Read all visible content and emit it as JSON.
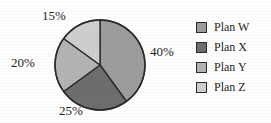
{
  "chart_data": {
    "type": "pie",
    "title": "",
    "subtitle": "",
    "xlabel": "",
    "ylabel": "",
    "grid": false,
    "legend_position": "right",
    "start_angle_deg": 0,
    "direction": "clockwise",
    "total": 100,
    "units": "percent",
    "categories": [
      "Plan W",
      "Plan X",
      "Plan Y",
      "Plan Z"
    ],
    "values": [
      40,
      25,
      20,
      15
    ],
    "data_labels": [
      "40%",
      "25%",
      "20%",
      "15%"
    ],
    "slices": [
      {
        "label": "Plan W",
        "value": 40,
        "data_label": "40%",
        "color": "#9d9d9d",
        "label_position": "right",
        "start_angle_deg": 0,
        "end_angle_deg": 144
      },
      {
        "label": "Plan X",
        "value": 25,
        "data_label": "25%",
        "color": "#6e6e6e",
        "label_position": "bottom",
        "start_angle_deg": 144,
        "end_angle_deg": 234
      },
      {
        "label": "Plan Y",
        "value": 20,
        "data_label": "20%",
        "color": "#b4b4b4",
        "label_position": "left",
        "start_angle_deg": 234,
        "end_angle_deg": 306
      },
      {
        "label": "Plan Z",
        "value": 15,
        "data_label": "15%",
        "color": "#cfcfcf",
        "label_position": "top-left",
        "start_angle_deg": 306,
        "end_angle_deg": 360
      }
    ],
    "geometry": {
      "center_x": 100,
      "center_y": 65,
      "radius": 45,
      "stroke_color": "#2b2b2b",
      "stroke_width": 1.4
    }
  },
  "legend": {
    "items": [
      {
        "label": "Plan W",
        "color": "#9d9d9d"
      },
      {
        "label": "Plan X",
        "color": "#6e6e6e"
      },
      {
        "label": "Plan Y",
        "color": "#b4b4b4"
      },
      {
        "label": "Plan Z",
        "color": "#cfcfcf"
      }
    ]
  },
  "canvas": {
    "background": "#ffffff",
    "width": 271,
    "height": 123
  }
}
